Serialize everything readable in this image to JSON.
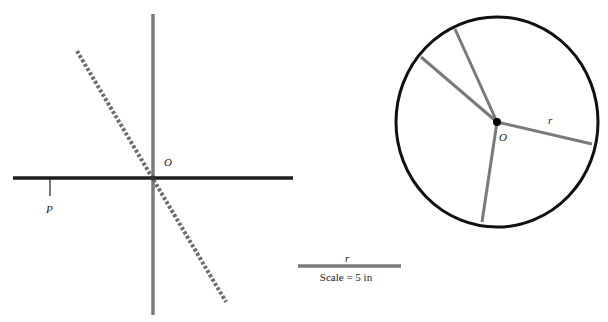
{
  "figure": {
    "left_panel": {
      "origin_label": "O",
      "point_label": "P",
      "colors": {
        "horizontal_axis": "#1e1e1e",
        "vertical_axis": "#7a7a7a",
        "dashed_line": "#6e6e6e",
        "tick": "#1e1e1e"
      }
    },
    "right_panel": {
      "center_label": "O",
      "radius_label": "r",
      "colors": {
        "circle": "#111111",
        "spokes": "#7a7a7a",
        "center_dot": "#000000"
      }
    },
    "scale_bar": {
      "label": "r",
      "caption": "Scale = 5 in",
      "color": "#7a7a7a"
    }
  }
}
